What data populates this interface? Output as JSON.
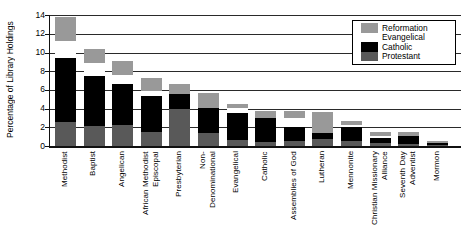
{
  "chart_data": {
    "type": "bar",
    "stacked": true,
    "title": "",
    "ylabel": "Percentage of Library Holdings",
    "xlabel": "",
    "ylim": [
      0,
      14
    ],
    "yticks": [
      0,
      2,
      4,
      6,
      8,
      10,
      12,
      14
    ],
    "grid": true,
    "legend_position": "top-right",
    "categories": [
      {
        "label": "Methodist",
        "lines": [
          "Methodist"
        ]
      },
      {
        "label": "Baptist",
        "lines": [
          "Baptist"
        ]
      },
      {
        "label": "Angelican",
        "lines": [
          "Angelican"
        ]
      },
      {
        "label": "African Methodist Episcopal",
        "lines": [
          "African Methodist",
          "Episcopal"
        ]
      },
      {
        "label": "Presbyterian",
        "lines": [
          "Presbyterian"
        ]
      },
      {
        "label": "Non-Denominational",
        "lines": [
          "Non-",
          "Denominational"
        ]
      },
      {
        "label": "Evangelical",
        "lines": [
          "Evangelical"
        ]
      },
      {
        "label": "Catholic",
        "lines": [
          "Catholic"
        ]
      },
      {
        "label": "Assemblies of God",
        "lines": [
          "Assemblies of God"
        ]
      },
      {
        "label": "Lutheran",
        "lines": [
          "Lutheran"
        ]
      },
      {
        "label": "Mennonite",
        "lines": [
          "Mennonite"
        ]
      },
      {
        "label": "Christian Missionary Alliance",
        "lines": [
          "Christian Missionary",
          "Alliance"
        ]
      },
      {
        "label": "Seventh Day Adventist",
        "lines": [
          "Seventh Day",
          "Adventist"
        ]
      },
      {
        "label": "Mormon",
        "lines": [
          "Mormon"
        ]
      }
    ],
    "series": [
      {
        "name": "Protestant",
        "color": "#595959",
        "values": [
          2.6,
          2.1,
          2.2,
          1.5,
          4.0,
          1.4,
          0.6,
          0.45,
          0.5,
          0.7,
          0.5,
          0.3,
          0.2,
          0.15
        ]
      },
      {
        "name": "Catholic",
        "color": "#000000",
        "values": [
          6.8,
          5.4,
          4.4,
          3.9,
          1.6,
          2.65,
          2.9,
          2.5,
          1.5,
          0.7,
          1.5,
          0.6,
          0.9,
          0.2
        ]
      },
      {
        "name": "Evangelical",
        "color": "#ffffff",
        "values": [
          1.8,
          1.4,
          1.0,
          0.5,
          0,
          0,
          0.55,
          0,
          1.0,
          0,
          0.25,
          0.2,
          0,
          0
        ]
      },
      {
        "name": "Reformation",
        "color": "#999999",
        "values": [
          2.65,
          1.5,
          1.5,
          1.4,
          1.0,
          1.6,
          0.5,
          0.75,
          0.7,
          2.2,
          0.45,
          0.4,
          0.35,
          0.15
        ]
      }
    ],
    "legend": [
      {
        "label": "Reformation",
        "color": "#999999"
      },
      {
        "label": "Evangelical",
        "color": "#ffffff"
      },
      {
        "label": "Catholic",
        "color": "#000000"
      },
      {
        "label": "Protestant",
        "color": "#595959"
      }
    ],
    "colors": {
      "axis": "#111111",
      "grid": "#2a2a2a",
      "background": "#ffffff"
    }
  }
}
